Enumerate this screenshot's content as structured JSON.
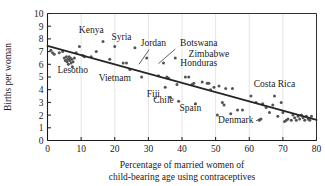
{
  "chart_data": {
    "type": "scatter",
    "title": "",
    "xlabel": "Percentage of married women of child-bearing age using contraceptives",
    "xlabel_line1": "Percentage of married women of",
    "xlabel_line2": "child-bearing age using contraceptives",
    "ylabel": "Births per woman",
    "xlim": [
      0,
      80
    ],
    "ylim": [
      0,
      10
    ],
    "xticks": [
      0,
      10,
      20,
      30,
      40,
      50,
      60,
      70,
      80
    ],
    "yticks": [
      0,
      1,
      2,
      3,
      4,
      5,
      6,
      7,
      8,
      9,
      10
    ],
    "xtick_labels": [
      "0",
      "10",
      "20",
      "30",
      "40",
      "50",
      "60",
      "70",
      "80"
    ],
    "ytick_labels": [
      "0",
      "1",
      "2",
      "3",
      "4",
      "5",
      "6",
      "7",
      "8",
      "9",
      "10"
    ],
    "grid": true,
    "grid_color": "#d8d8d8",
    "legend": "none",
    "marker_color": "#555555",
    "trendline_color": "#262626",
    "trendline": {
      "label": "least-squares regression line",
      "x0": 0,
      "y0": 7.45,
      "x1": 80,
      "y1": 1.62
    },
    "points": [
      {
        "x": 1.0,
        "y": 7.1
      },
      {
        "x": 1.5,
        "y": 6.9
      },
      {
        "x": 2.0,
        "y": 6.8
      },
      {
        "x": 3.5,
        "y": 6.9
      },
      {
        "x": 4.5,
        "y": 7.0
      },
      {
        "x": 5.0,
        "y": 6.5
      },
      {
        "x": 5.3,
        "y": 6.3
      },
      {
        "x": 5.6,
        "y": 6.6
      },
      {
        "x": 5.8,
        "y": 6.2
      },
      {
        "x": 6.0,
        "y": 6.4
      },
      {
        "x": 6.2,
        "y": 6.0
      },
      {
        "x": 6.4,
        "y": 6.6
      },
      {
        "x": 6.6,
        "y": 6.3
      },
      {
        "x": 6.8,
        "y": 6.5
      },
      {
        "x": 7.0,
        "y": 6.1
      },
      {
        "x": 7.2,
        "y": 6.4
      },
      {
        "x": 7.4,
        "y": 5.8
      },
      {
        "x": 7.6,
        "y": 6.2
      },
      {
        "x": 8.0,
        "y": 6.5
      },
      {
        "x": 8.5,
        "y": 6.9
      },
      {
        "x": 9.5,
        "y": 7.4
      },
      {
        "x": 10.5,
        "y": 6.7
      },
      {
        "x": 11.0,
        "y": 6.6
      },
      {
        "x": 13.0,
        "y": 6.6
      },
      {
        "x": 14.5,
        "y": 7.0
      },
      {
        "x": 16.5,
        "y": 7.8
      },
      {
        "x": 18.5,
        "y": 6.4
      },
      {
        "x": 20.0,
        "y": 7.4
      },
      {
        "x": 22.5,
        "y": 6.1
      },
      {
        "x": 23.5,
        "y": 6.1
      },
      {
        "x": 24.5,
        "y": 5.6
      },
      {
        "x": 26.0,
        "y": 7.3
      },
      {
        "x": 28.0,
        "y": 5.0
      },
      {
        "x": 29.5,
        "y": 6.5
      },
      {
        "x": 33.0,
        "y": 5.1
      },
      {
        "x": 34.5,
        "y": 6.1
      },
      {
        "x": 35.0,
        "y": 4.2
      },
      {
        "x": 35.5,
        "y": 5.0
      },
      {
        "x": 36.0,
        "y": 4.9
      },
      {
        "x": 36.5,
        "y": 3.4
      },
      {
        "x": 38.0,
        "y": 6.5
      },
      {
        "x": 38.5,
        "y": 4.4
      },
      {
        "x": 39.0,
        "y": 3.1
      },
      {
        "x": 41.0,
        "y": 5.0
      },
      {
        "x": 42.0,
        "y": 5.0
      },
      {
        "x": 43.0,
        "y": 4.4
      },
      {
        "x": 43.5,
        "y": 4.5
      },
      {
        "x": 44.0,
        "y": 2.9
      },
      {
        "x": 46.0,
        "y": 4.6
      },
      {
        "x": 47.5,
        "y": 4.5
      },
      {
        "x": 48.0,
        "y": 4.5
      },
      {
        "x": 48.5,
        "y": 4.0
      },
      {
        "x": 49.5,
        "y": 4.2
      },
      {
        "x": 50.5,
        "y": 2.0
      },
      {
        "x": 51.0,
        "y": 4.3
      },
      {
        "x": 52.0,
        "y": 3.0
      },
      {
        "x": 52.5,
        "y": 2.8
      },
      {
        "x": 53.0,
        "y": 4.1
      },
      {
        "x": 54.5,
        "y": 2.1
      },
      {
        "x": 55.0,
        "y": 4.1
      },
      {
        "x": 56.5,
        "y": 2.4
      },
      {
        "x": 58.0,
        "y": 2.4
      },
      {
        "x": 60.5,
        "y": 3.5
      },
      {
        "x": 62.0,
        "y": 3.0
      },
      {
        "x": 63.0,
        "y": 1.6
      },
      {
        "x": 63.5,
        "y": 1.7
      },
      {
        "x": 64.0,
        "y": 2.9
      },
      {
        "x": 65.0,
        "y": 2.6
      },
      {
        "x": 66.0,
        "y": 2.2
      },
      {
        "x": 67.0,
        "y": 2.8
      },
      {
        "x": 67.5,
        "y": 3.5
      },
      {
        "x": 68.5,
        "y": 1.9
      },
      {
        "x": 69.5,
        "y": 3.0
      },
      {
        "x": 70.0,
        "y": 2.2
      },
      {
        "x": 70.5,
        "y": 1.5
      },
      {
        "x": 71.0,
        "y": 1.6
      },
      {
        "x": 71.5,
        "y": 1.7
      },
      {
        "x": 72.5,
        "y": 1.6
      },
      {
        "x": 73.0,
        "y": 2.0
      },
      {
        "x": 73.5,
        "y": 1.8
      },
      {
        "x": 74.0,
        "y": 1.6
      },
      {
        "x": 74.5,
        "y": 1.9
      },
      {
        "x": 75.0,
        "y": 1.7
      },
      {
        "x": 75.5,
        "y": 2.0
      },
      {
        "x": 76.0,
        "y": 1.8
      },
      {
        "x": 76.5,
        "y": 1.6
      },
      {
        "x": 77.0,
        "y": 1.9
      },
      {
        "x": 77.5,
        "y": 1.7
      },
      {
        "x": 78.0,
        "y": 1.6
      },
      {
        "x": 78.5,
        "y": 1.9
      }
    ],
    "annotations": [
      {
        "name": "Kenya",
        "text": "Kenya",
        "x": 13.0,
        "y": 8.45,
        "anchor": "middle",
        "leader": null
      },
      {
        "name": "Syria",
        "text": "Syria",
        "x": 22.0,
        "y": 7.95,
        "anchor": "middle",
        "leader": null
      },
      {
        "name": "Jordan",
        "text": "Jordan",
        "x": 31.5,
        "y": 7.45,
        "anchor": "middle",
        "leader": {
          "x1": 30.2,
          "y1": 7.15,
          "x2": 27.2,
          "y2": 6.0
        }
      },
      {
        "name": "Botswana",
        "text": "Botswana",
        "x": 45.0,
        "y": 7.45,
        "anchor": "middle",
        "leader": {
          "x1": 38.0,
          "y1": 7.2,
          "x2": 33.0,
          "y2": 6.05
        }
      },
      {
        "name": "Zimbabwe",
        "text": "Zimbabwe",
        "x": 48.0,
        "y": 6.55,
        "anchor": "middle",
        "leader": null
      },
      {
        "name": "Honduras",
        "text": "Honduras",
        "x": 45.0,
        "y": 5.85,
        "anchor": "middle",
        "leader": null
      },
      {
        "name": "Lesotho",
        "text": "Lesotho",
        "x": 7.5,
        "y": 5.35,
        "anchor": "middle",
        "leader": null
      },
      {
        "name": "Vietnam",
        "text": "Vietnam",
        "x": 20.0,
        "y": 4.65,
        "anchor": "middle",
        "leader": null
      },
      {
        "name": "Fiji",
        "text": "Fiji",
        "x": 31.5,
        "y": 3.45,
        "anchor": "middle",
        "leader": null
      },
      {
        "name": "Chile",
        "text": "Chile",
        "x": 34.5,
        "y": 2.95,
        "anchor": "middle",
        "leader": null
      },
      {
        "name": "Spain",
        "text": "Spain",
        "x": 42.5,
        "y": 2.35,
        "anchor": "middle",
        "leader": null
      },
      {
        "name": "Denmark",
        "text": "Denmark",
        "x": 56.0,
        "y": 1.35,
        "anchor": "middle",
        "leader": {
          "x1": 62.0,
          "y1": 1.55,
          "x2": 63.2,
          "y2": 1.72
        }
      },
      {
        "name": "Costa Rica",
        "text": "Costa Rica",
        "x": 67.5,
        "y": 4.25,
        "anchor": "middle",
        "leader": null
      }
    ]
  }
}
